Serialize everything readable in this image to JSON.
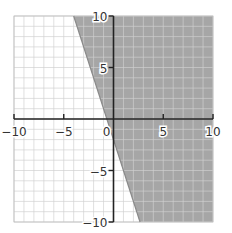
{
  "chart_data": {
    "type": "area",
    "title": "",
    "xlabel": "",
    "ylabel": "",
    "xlim": [
      -10,
      10
    ],
    "ylim": [
      -10,
      10
    ],
    "grid": true,
    "grid_step": 1,
    "x_ticks": [
      -10,
      -5,
      0,
      5,
      10
    ],
    "y_ticks": [
      -10,
      -5,
      5,
      10
    ],
    "x_tick_labels": [
      "−10",
      "−5",
      "0",
      "5",
      "10"
    ],
    "y_tick_labels": [
      "−10",
      "−5",
      "5",
      "10"
    ],
    "boundary_line": {
      "equation": "y = -3x - 2",
      "slope": -3,
      "intercept": -2,
      "style": "solid"
    },
    "inequality": "y ≥ -3x - 2",
    "shaded_region": "right of / above boundary line",
    "shade_color": "#a6a6a6",
    "grid_color": "#cfcfcf",
    "axis_color": "#222222",
    "legend": []
  }
}
